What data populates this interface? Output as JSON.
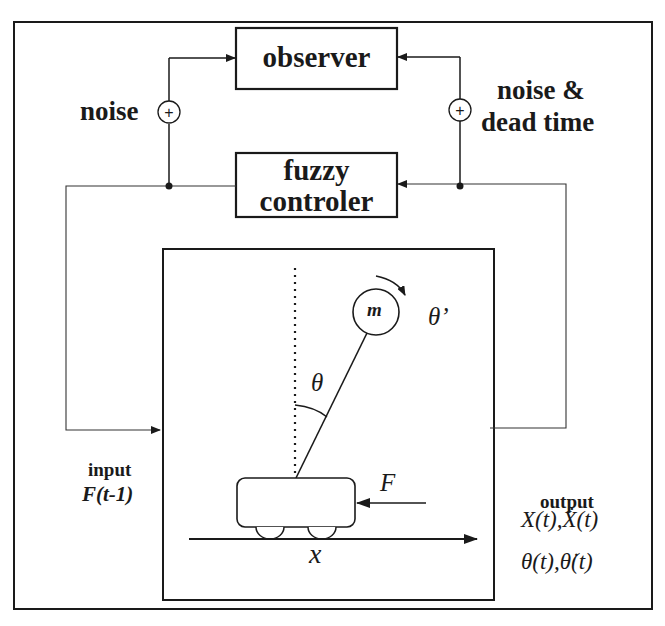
{
  "diagram": {
    "type": "block-diagram",
    "title": "",
    "blocks": {
      "observer": {
        "label": "observer"
      },
      "fuzzy_controller": {
        "label_line1": "fuzzy",
        "label_line2": "controler"
      },
      "plant": {
        "label": "inverted pendulum on cart"
      }
    },
    "labels": {
      "noise_left": "noise",
      "noise_right_line1": "noise &",
      "noise_right_line2": "dead time",
      "sum_symbol": "+",
      "input_title": "input",
      "input_signal": "F(t-1)",
      "output_title": "output",
      "output_line1": "X(t),Ẋ(t)",
      "output_line2": "θ(t),θ̇(t)"
    },
    "plant_labels": {
      "mass": "m",
      "angle": "θ",
      "angular_velocity": "θ’",
      "force": "F",
      "position": "x"
    },
    "colors": {
      "line": "#1a1a1a",
      "thin_line": "#555555",
      "background": "#ffffff"
    }
  }
}
